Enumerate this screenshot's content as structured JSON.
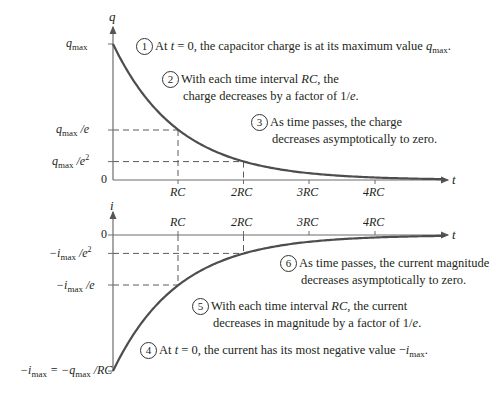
{
  "top_graph": {
    "y_axis_label": "q",
    "x_axis_label": "t",
    "y_ticks": [
      {
        "id": "qmax",
        "var": "q",
        "sub": "max",
        "suffix": ""
      },
      {
        "id": "qmax_e",
        "var": "q",
        "sub": "max",
        "suffix": " /e"
      },
      {
        "id": "qmax_e2",
        "var": "q",
        "sub": "max",
        "suffix": " /e",
        "sup": "2"
      },
      {
        "id": "zero",
        "text": "0"
      }
    ],
    "x_ticks": [
      "RC",
      "2RC",
      "3RC",
      "4RC"
    ],
    "notes": [
      {
        "num": "1",
        "line1_pre": "At ",
        "line1_var": "t",
        "line1_mid": " = 0, the capacitor charge is at its maximum value ",
        "line1_end_var": "q",
        "line1_end_sub": "max",
        "line1_end": "."
      },
      {
        "num": "2",
        "line1": "With each time interval ",
        "line1_var": "RC",
        "line1_post": ", the",
        "line2": "charge decreases by a factor of 1/",
        "line2_var": "e",
        "line2_post": "."
      },
      {
        "num": "3",
        "line1": "As time passes, the charge",
        "line2": "decreases asymptotically to zero."
      }
    ]
  },
  "bottom_graph": {
    "y_axis_label": "i",
    "x_axis_label": "t",
    "y_ticks": [
      {
        "id": "zero",
        "text": "0"
      },
      {
        "id": "imax_e2",
        "text": "−i",
        "sub": "max",
        "suffix": " /e",
        "sup": "2"
      },
      {
        "id": "imax_e",
        "text": "−i",
        "sub": "max",
        "suffix": " /e"
      },
      {
        "id": "imax",
        "text": "−i",
        "sub": "max",
        "mid": " = −q",
        "sub2": "max",
        "suffix": " /RC"
      }
    ],
    "x_ticks": [
      "RC",
      "2RC",
      "3RC",
      "4RC"
    ],
    "notes": [
      {
        "num": "4",
        "line1_pre": "At ",
        "line1_var": "t",
        "line1_mid": " = 0, the current has its most negative value −",
        "line1_end_var": "i",
        "line1_end_sub": "max",
        "line1_end": "."
      },
      {
        "num": "5",
        "line1": "With each time interval ",
        "line1_var": "RC",
        "line1_post": ", the current",
        "line2": "decreases in magnitude by a factor of 1/",
        "line2_var": "e",
        "line2_post": "."
      },
      {
        "num": "6",
        "line1": "As time passes, the current magnitude",
        "line2": "decreases asymptotically to zero."
      }
    ]
  },
  "colors": {
    "curve": "#4d4d4d",
    "axis": "#6d6d6d",
    "dashed": "#5a5a5a",
    "text": "#231f20"
  },
  "chart_data": [
    {
      "type": "line",
      "title": "Capacitor charge vs time (discharging RC circuit)",
      "xlabel": "t",
      "ylabel": "q",
      "x": [
        "0",
        "RC",
        "2RC",
        "3RC",
        "4RC"
      ],
      "series": [
        {
          "name": "q(t) = q_max e^(-t/RC)",
          "values": [
            1.0,
            0.368,
            0.135,
            0.05,
            0.018
          ]
        }
      ],
      "ytick_labels": [
        "q_max",
        "q_max/e",
        "q_max/e^2",
        "0"
      ]
    },
    {
      "type": "line",
      "title": "Current vs time (discharging RC circuit)",
      "xlabel": "t",
      "ylabel": "i",
      "x": [
        "0",
        "RC",
        "2RC",
        "3RC",
        "4RC"
      ],
      "series": [
        {
          "name": "i(t) = -i_max e^(-t/RC)",
          "values": [
            -1.0,
            -0.368,
            -0.135,
            -0.05,
            -0.018
          ]
        }
      ],
      "ytick_labels": [
        "0",
        "-i_max/e^2",
        "-i_max/e",
        "-i_max = -q_max/RC"
      ]
    }
  ]
}
